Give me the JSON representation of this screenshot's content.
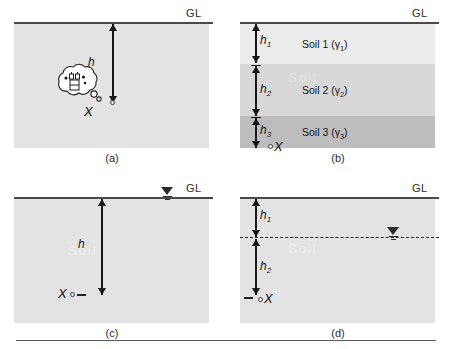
{
  "figure": {
    "ground_level_label": "GL",
    "panels": [
      {
        "id": "a",
        "caption": "(a)",
        "depth_label": "h",
        "point_label": "X",
        "has_thought_bubble": true,
        "has_water_table": false,
        "layers": [
          {
            "name": "",
            "shade": "#e3e3e3"
          }
        ]
      },
      {
        "id": "b",
        "caption": "(b)",
        "point_label": "X",
        "has_thought_bubble": false,
        "has_water_table": false,
        "depth_labels": [
          {
            "text": "h",
            "sub": "1"
          },
          {
            "text": "h",
            "sub": "2"
          },
          {
            "text": "h",
            "sub": "3"
          }
        ],
        "layers": [
          {
            "name": "Soil 1",
            "unit_weight": "γ",
            "unit_weight_sub": "1",
            "shade": "#ececec"
          },
          {
            "name": "Soil 2",
            "unit_weight": "γ",
            "unit_weight_sub": "2",
            "shade": "#d8d8d8"
          },
          {
            "name": "Soil 3",
            "unit_weight": "γ",
            "unit_weight_sub": "3",
            "shade": "#bdbdbd"
          }
        ]
      },
      {
        "id": "c",
        "caption": "(c)",
        "depth_label": "h",
        "point_label": "X",
        "has_thought_bubble": false,
        "has_water_table": true,
        "water_table_at_ground_level": true,
        "layers": [
          {
            "name": "",
            "shade": "#e3e3e3"
          }
        ]
      },
      {
        "id": "d",
        "caption": "(d)",
        "point_label": "X",
        "has_thought_bubble": false,
        "has_water_table": true,
        "water_table_at_ground_level": false,
        "depth_labels": [
          {
            "text": "h",
            "sub": "1"
          },
          {
            "text": "h",
            "sub": "2"
          }
        ],
        "layers": [
          {
            "name": "",
            "shade": "#e3e3e3"
          }
        ]
      }
    ],
    "colors": {
      "ground_line": "#4a4a4a",
      "soil_default": "#e3e3e3",
      "soil_layer_1": "#ececec",
      "soil_layer_2": "#d8d8d8",
      "soil_layer_3": "#bdbdbd",
      "arrow": "#171717",
      "text": "#1a1a1a",
      "rule": "#5a5a5a"
    }
  }
}
